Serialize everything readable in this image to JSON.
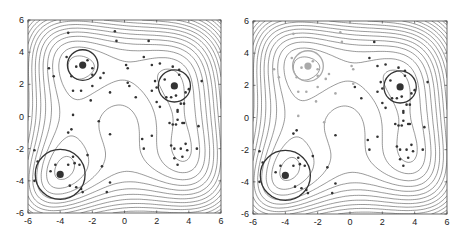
{
  "chart_data": [
    {
      "type": "scatter",
      "title": "",
      "xlabel": "",
      "ylabel": "",
      "xlim": [
        -6,
        6
      ],
      "ylim": [
        -6,
        6
      ],
      "xticks": [
        -6,
        -4,
        -2,
        0,
        2,
        4,
        6
      ],
      "yticks": [
        -6,
        -4,
        -2,
        0,
        2,
        4,
        6
      ],
      "grid": false,
      "background": "contour plot (Himmelblau-like function, 4 basins)",
      "circles": [
        {
          "cx": -2.6,
          "cy": 3.2,
          "r": 0.95,
          "color": "#333333"
        },
        {
          "cx": 3.1,
          "cy": 1.9,
          "r": 1.0,
          "color": "#333333"
        },
        {
          "cx": -4.0,
          "cy": -3.6,
          "r": 1.55,
          "color": "#333333"
        }
      ],
      "centers": [
        {
          "x": -2.6,
          "y": 3.2,
          "color": "#333333"
        },
        {
          "x": 3.1,
          "y": 1.9,
          "color": "#333333"
        },
        {
          "x": -4.0,
          "y": -3.6,
          "color": "#333333"
        }
      ],
      "series": [
        {
          "name": "samples",
          "color": "#333333",
          "points": [
            [
              -3.5,
              5.2
            ],
            [
              -0.6,
              5.3
            ],
            [
              -0.5,
              4.7
            ],
            [
              1.5,
              4.7
            ],
            [
              -4.7,
              3.0
            ],
            [
              -4.4,
              2.5
            ],
            [
              -3.6,
              3.7
            ],
            [
              -3.0,
              3.1
            ],
            [
              -2.3,
              3.5
            ],
            [
              -2.0,
              3.0
            ],
            [
              -3.3,
              2.5
            ],
            [
              -2.0,
              2.6
            ],
            [
              -1.3,
              2.7
            ],
            [
              -1.5,
              2.4
            ],
            [
              -3.2,
              1.6
            ],
            [
              -2.7,
              1.6
            ],
            [
              -2.1,
              1.0
            ],
            [
              -2.0,
              1.9
            ],
            [
              0.1,
              3.2
            ],
            [
              0.2,
              3.0
            ],
            [
              1.2,
              3.7
            ],
            [
              1.7,
              3.2
            ],
            [
              2.2,
              3.3
            ],
            [
              2.5,
              2.3
            ],
            [
              1.9,
              2.2
            ],
            [
              1.7,
              1.6
            ],
            [
              2.0,
              1.8
            ],
            [
              0.2,
              2.1
            ],
            [
              0.3,
              1.9
            ],
            [
              -0.9,
              1.5
            ],
            [
              0.7,
              1.2
            ],
            [
              2.0,
              0.9
            ],
            [
              2.2,
              0.6
            ],
            [
              3.0,
              3.1
            ],
            [
              3.4,
              2.9
            ],
            [
              3.4,
              2.6
            ],
            [
              4.0,
              1.7
            ],
            [
              3.8,
              1.5
            ],
            [
              2.6,
              1.2
            ],
            [
              2.9,
              1.2
            ],
            [
              3.2,
              1.3
            ],
            [
              3.7,
              0.8
            ],
            [
              3.5,
              0.8
            ],
            [
              3.3,
              0.4
            ],
            [
              3.3,
              0.3
            ],
            [
              3.3,
              -0.2
            ],
            [
              3.0,
              -0.5
            ],
            [
              3.2,
              -0.5
            ],
            [
              3.6,
              -0.4
            ],
            [
              3.7,
              -0.4
            ],
            [
              2.8,
              -0.4
            ],
            [
              4.6,
              -0.6
            ],
            [
              4.8,
              2.2
            ],
            [
              -3.2,
              0.1
            ],
            [
              -3.3,
              -0.8
            ],
            [
              -3.5,
              -1.0
            ],
            [
              -1.6,
              -0.3
            ],
            [
              -0.9,
              -1.1
            ],
            [
              1.1,
              -1.4
            ],
            [
              1.2,
              -2.0
            ],
            [
              1.7,
              -1.2
            ],
            [
              2.9,
              -1.8
            ],
            [
              3.1,
              -2.0
            ],
            [
              3.5,
              -2.0
            ],
            [
              3.8,
              -1.7
            ],
            [
              3.9,
              -2.1
            ],
            [
              3.6,
              -2.5
            ],
            [
              3.1,
              -2.6
            ],
            [
              3.3,
              -3.0
            ],
            [
              4.5,
              -2.0
            ],
            [
              -5.6,
              -2.1
            ],
            [
              -5.4,
              -2.8
            ],
            [
              -5.6,
              -4.0
            ],
            [
              -4.3,
              -3.0
            ],
            [
              -4.6,
              -3.4
            ],
            [
              -3.5,
              -3.0
            ],
            [
              -3.2,
              -2.5
            ],
            [
              -3.1,
              -2.9
            ],
            [
              -2.8,
              -3.0
            ],
            [
              -2.3,
              -2.4
            ],
            [
              -3.4,
              -4.3
            ],
            [
              -3.0,
              -4.4
            ],
            [
              -2.7,
              -4.5
            ],
            [
              -2.6,
              -4.7
            ],
            [
              -1.4,
              -3.1
            ],
            [
              -1.1,
              -4.7
            ],
            [
              -0.9,
              -4.1
            ]
          ]
        }
      ]
    },
    {
      "type": "scatter",
      "title": "",
      "xlabel": "",
      "ylabel": "",
      "xlim": [
        -6,
        6
      ],
      "ylim": [
        -6,
        6
      ],
      "xticks": [
        -6,
        -4,
        -2,
        0,
        2,
        4,
        6
      ],
      "yticks": [
        -6,
        -4,
        -2,
        0,
        2,
        4,
        6
      ],
      "grid": false,
      "background": "contour plot (Himmelblau-like function, 4 basins)",
      "circles": [
        {
          "cx": -2.6,
          "cy": 3.2,
          "r": 0.95,
          "color": "#aaaaaa"
        },
        {
          "cx": 3.1,
          "cy": 1.9,
          "r": 1.0,
          "color": "#333333"
        },
        {
          "cx": -4.0,
          "cy": -3.6,
          "r": 1.55,
          "color": "#333333"
        }
      ],
      "centers": [
        {
          "x": -2.6,
          "y": 3.2,
          "color": "#aaaaaa"
        },
        {
          "x": 3.1,
          "y": 1.9,
          "color": "#333333"
        },
        {
          "x": -4.0,
          "y": -3.6,
          "color": "#333333"
        }
      ],
      "series": [
        {
          "name": "samples-faded",
          "color": "#aaaaaa",
          "points": [
            [
              -3.5,
              5.2
            ],
            [
              -0.6,
              5.3
            ],
            [
              -0.5,
              4.7
            ],
            [
              -4.7,
              3.0
            ],
            [
              -4.4,
              2.5
            ],
            [
              -3.6,
              3.7
            ],
            [
              -3.0,
              3.1
            ],
            [
              -2.3,
              3.5
            ],
            [
              -2.0,
              3.0
            ],
            [
              -3.3,
              2.5
            ],
            [
              -2.0,
              2.6
            ],
            [
              -1.3,
              2.7
            ],
            [
              -1.5,
              2.4
            ],
            [
              -3.2,
              1.6
            ],
            [
              -2.7,
              1.6
            ],
            [
              -2.1,
              1.0
            ],
            [
              -2.0,
              1.9
            ],
            [
              0.1,
              3.2
            ],
            [
              0.2,
              3.0
            ],
            [
              0.2,
              2.1
            ],
            [
              -0.9,
              1.5
            ],
            [
              -3.2,
              0.1
            ],
            [
              -1.6,
              -0.3
            ]
          ]
        },
        {
          "name": "samples",
          "color": "#333333",
          "points": [
            [
              1.5,
              4.7
            ],
            [
              1.2,
              3.7
            ],
            [
              1.7,
              3.2
            ],
            [
              2.2,
              3.3
            ],
            [
              2.5,
              2.3
            ],
            [
              1.9,
              2.2
            ],
            [
              1.7,
              1.6
            ],
            [
              2.0,
              1.8
            ],
            [
              0.3,
              1.9
            ],
            [
              0.7,
              1.2
            ],
            [
              2.0,
              0.9
            ],
            [
              2.2,
              0.6
            ],
            [
              3.0,
              3.1
            ],
            [
              3.4,
              2.9
            ],
            [
              3.4,
              2.6
            ],
            [
              4.0,
              1.7
            ],
            [
              3.8,
              1.5
            ],
            [
              2.6,
              1.2
            ],
            [
              2.9,
              1.2
            ],
            [
              3.2,
              1.3
            ],
            [
              3.7,
              0.8
            ],
            [
              3.5,
              0.8
            ],
            [
              3.3,
              0.4
            ],
            [
              3.3,
              0.3
            ],
            [
              3.3,
              -0.2
            ],
            [
              3.0,
              -0.5
            ],
            [
              3.2,
              -0.5
            ],
            [
              3.6,
              -0.4
            ],
            [
              3.7,
              -0.4
            ],
            [
              2.8,
              -0.4
            ],
            [
              4.6,
              -0.6
            ],
            [
              4.8,
              2.2
            ],
            [
              -3.3,
              -0.8
            ],
            [
              -3.5,
              -1.0
            ],
            [
              -0.9,
              -1.1
            ],
            [
              1.1,
              -1.4
            ],
            [
              1.2,
              -2.0
            ],
            [
              1.7,
              -1.2
            ],
            [
              2.9,
              -1.8
            ],
            [
              3.1,
              -2.0
            ],
            [
              3.5,
              -2.0
            ],
            [
              3.8,
              -1.7
            ],
            [
              3.9,
              -2.1
            ],
            [
              3.6,
              -2.5
            ],
            [
              3.1,
              -2.6
            ],
            [
              3.3,
              -3.0
            ],
            [
              4.5,
              -2.0
            ],
            [
              -5.6,
              -2.1
            ],
            [
              -5.4,
              -2.8
            ],
            [
              -5.6,
              -4.0
            ],
            [
              -4.3,
              -3.0
            ],
            [
              -4.6,
              -3.4
            ],
            [
              -3.5,
              -3.0
            ],
            [
              -3.2,
              -2.5
            ],
            [
              -3.1,
              -2.9
            ],
            [
              -2.8,
              -3.0
            ],
            [
              -2.3,
              -2.4
            ],
            [
              -3.4,
              -4.3
            ],
            [
              -3.0,
              -4.4
            ],
            [
              -2.7,
              -4.5
            ],
            [
              -2.6,
              -4.7
            ],
            [
              -1.4,
              -3.1
            ],
            [
              -1.1,
              -4.7
            ],
            [
              -0.9,
              -4.1
            ]
          ]
        }
      ]
    }
  ],
  "panels": [
    {
      "offset_x": 0,
      "plot": {
        "left": 28,
        "top": 20,
        "right": 221,
        "bottom": 213
      }
    },
    {
      "offset_x": 0,
      "plot": {
        "left": 253,
        "top": 21,
        "right": 447,
        "bottom": 214
      }
    }
  ],
  "colors": {
    "contour": "#555555",
    "axis": "#444444",
    "dark": "#2a2a2a",
    "faded": "#a8a8a8"
  }
}
